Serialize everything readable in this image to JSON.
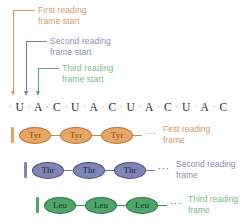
{
  "figure": {
    "background": "#ffffff"
  },
  "colors": {
    "first_frame": "#d99a62",
    "first_frame_text": "#d29a6a",
    "first_frame_fill": "#e8a664",
    "first_frame_stroke": "#b5713a",
    "first_frame_label": "#7a4a20",
    "second_frame": "#7b7fae",
    "second_frame_text": "#8b8fb5",
    "second_frame_fill": "#8086b4",
    "second_frame_stroke": "#4d5080",
    "second_frame_label": "#2a2c52",
    "third_frame": "#5aa86f",
    "third_frame_text": "#7cb98a",
    "third_frame_fill": "#4fa46a",
    "third_frame_stroke": "#2e7344",
    "third_frame_label": "#14401f",
    "sequence_text": "#2b2b2b",
    "sequence_dot": "#a09a92"
  },
  "callouts": [
    {
      "id": "first-reading-frame-start",
      "line1": "First reading",
      "line2": "frame start"
    },
    {
      "id": "second-reading-frame-start",
      "line1": "Second reading",
      "line2": "frame start"
    },
    {
      "id": "third-reading-frame-start",
      "line1": "Third reading",
      "line2": "frame start"
    }
  ],
  "rna": {
    "label": "mRNA sequence",
    "bases": [
      "U",
      "A",
      "C",
      "U",
      "A",
      "C",
      "U",
      "A",
      "C",
      "U",
      "A",
      "C"
    ],
    "separator": "·"
  },
  "frames": [
    {
      "id": "first-reading-frame",
      "amino_acid": "Tyr",
      "residues": [
        "Tyr",
        "Tyr",
        "Tyr"
      ],
      "continuation": "···",
      "caption_line1": "First reading",
      "caption_line2": "frame"
    },
    {
      "id": "second-reading-frame",
      "amino_acid": "Thr",
      "residues": [
        "Thr",
        "Thr",
        "Thr"
      ],
      "continuation": "···",
      "caption_line1": "Second reading",
      "caption_line2": "frame"
    },
    {
      "id": "third-reading-frame",
      "amino_acid": "Leu",
      "residues": [
        "Leu",
        "Leu",
        "Leu"
      ],
      "continuation": "···",
      "caption_line1": "Third reading",
      "caption_line2": "frame"
    }
  ]
}
